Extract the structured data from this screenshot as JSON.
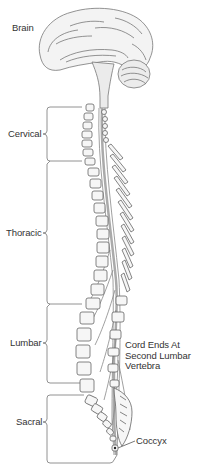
{
  "labels": {
    "brain": "Brain",
    "cervical": "Cervical",
    "thoracic": "Thoracic",
    "lumbar": "Lumbar",
    "sacral": "Sacral",
    "cord_end_line1": "Cord Ends At",
    "cord_end_line2": "Second Lumbar",
    "cord_end_line3": "Vertebra",
    "coccyx": "Coccyx"
  },
  "regions": [
    {
      "name": "Cervical",
      "top": 107,
      "bottom": 161
    },
    {
      "name": "Thoracic",
      "top": 161,
      "bottom": 304
    },
    {
      "name": "Lumbar",
      "top": 304,
      "bottom": 383
    },
    {
      "name": "Sacral",
      "top": 393,
      "bottom": 463
    }
  ],
  "colors": {
    "line": "#6a6a6a",
    "fill": "#f4f4f4",
    "text": "#333333",
    "cord": "#9a9a9a"
  }
}
